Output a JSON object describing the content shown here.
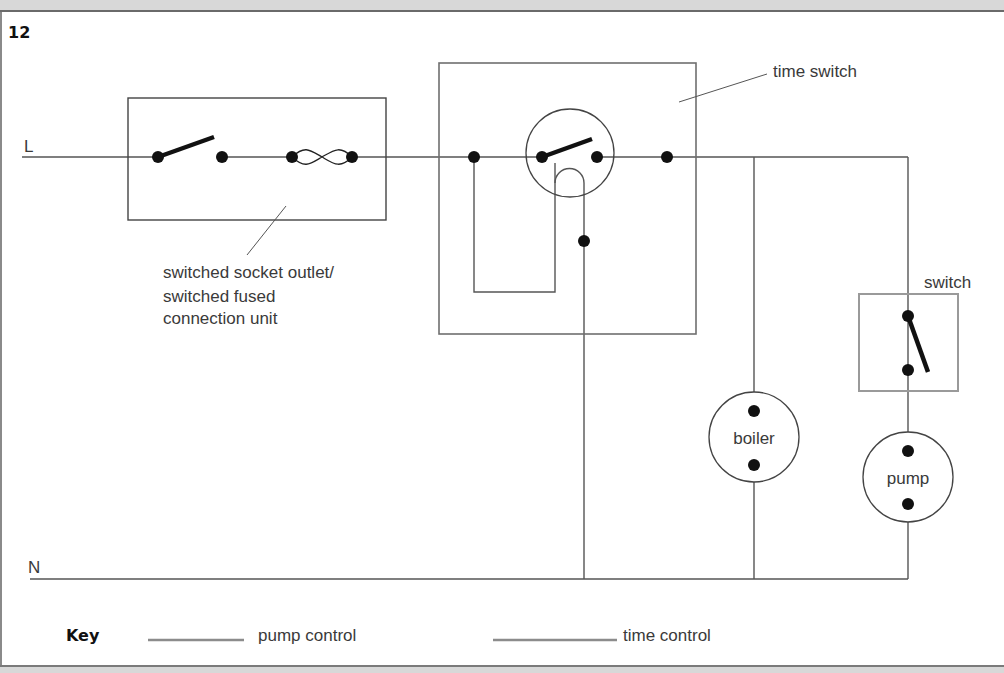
{
  "figure": {
    "number": "12"
  },
  "lines": {
    "live": "L",
    "neutral": "N"
  },
  "components": {
    "socket_outlet": {
      "label_line1": "switched socket outlet/",
      "label_line2": "switched fused",
      "label_line3": "connection unit"
    },
    "time_switch": {
      "label": "time switch"
    },
    "switch": {
      "label": "switch"
    },
    "boiler": {
      "label": "boiler"
    },
    "pump": {
      "label": "pump"
    }
  },
  "key": {
    "title": "Key",
    "items": [
      {
        "label": "pump control",
        "color": "#8c8c8c"
      },
      {
        "label": "time control",
        "color": "#8c8c8c"
      }
    ]
  },
  "colors": {
    "wire": "#555555",
    "box": "#6f6f6f",
    "switch_box": "#9a9a9a",
    "terminal": "#111111"
  }
}
